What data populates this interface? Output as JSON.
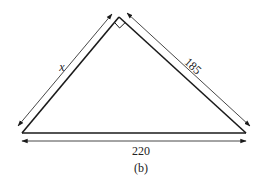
{
  "figure": {
    "caption": "(b)",
    "shape": "right triangle",
    "right_angle_at": "apex",
    "colors": {
      "stroke": "#1a1a1a",
      "background": "#ffffff"
    }
  },
  "labels": {
    "left_side": "x",
    "right_side": "185",
    "base": "220"
  },
  "dimensions": [
    {
      "side": "left",
      "label": "x",
      "unknown": true
    },
    {
      "side": "right",
      "label": "185",
      "value": 185
    },
    {
      "side": "base",
      "label": "220",
      "value": 220
    }
  ]
}
